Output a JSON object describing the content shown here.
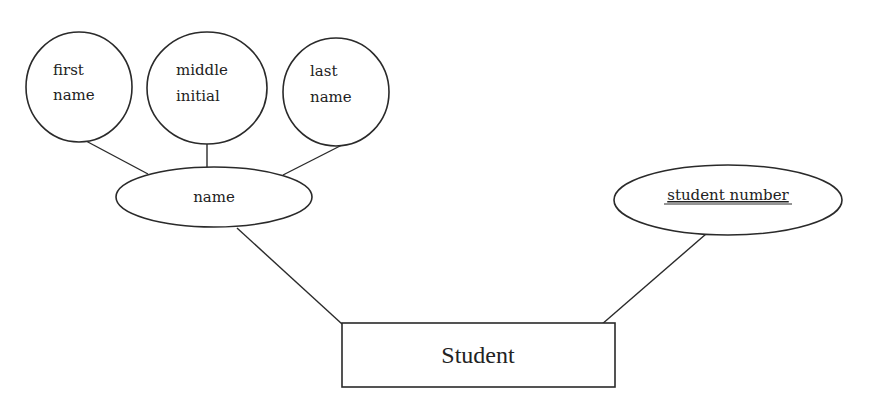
{
  "diagram": {
    "type": "ER diagram",
    "entity": {
      "label": "Student"
    },
    "attributes": {
      "first_name": {
        "line1": "first",
        "line2": "name"
      },
      "middle_initial": {
        "line1": "middle",
        "line2": "initial"
      },
      "last_name": {
        "line1": "last",
        "line2": "name"
      },
      "name": {
        "label": "name",
        "kind": "composite"
      },
      "student_number": {
        "label": "student number",
        "kind": "key"
      }
    },
    "relationships": [
      {
        "from": "first name",
        "to": "name"
      },
      {
        "from": "middle initial",
        "to": "name"
      },
      {
        "from": "last name",
        "to": "name"
      },
      {
        "from": "name",
        "to": "Student"
      },
      {
        "from": "student number",
        "to": "Student"
      }
    ],
    "colors": {
      "stroke": "#2a2a2a",
      "text": "#222222",
      "background": "#ffffff"
    }
  }
}
